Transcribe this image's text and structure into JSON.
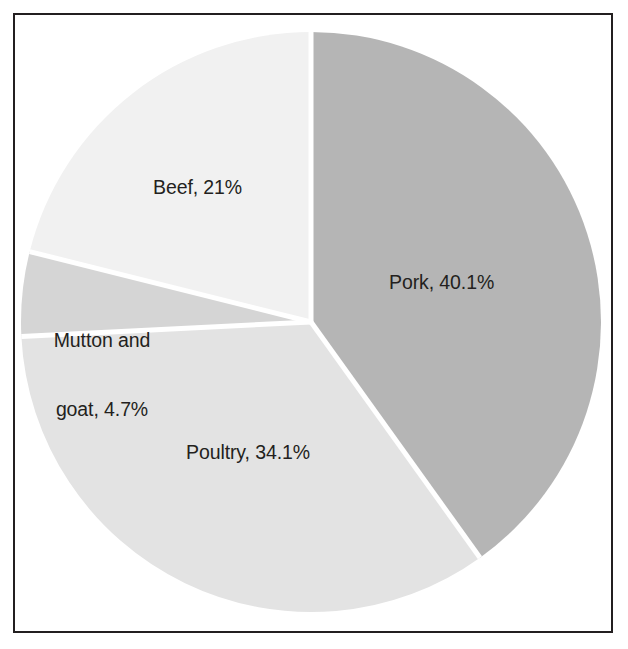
{
  "figure": {
    "kind": "pie-chart-figure",
    "background_color": "#ffffff",
    "frame_color": "#231f20",
    "label_text_color": "#231f20"
  },
  "chart_data": {
    "type": "pie",
    "title": "",
    "subtitle": "",
    "xlabel": "",
    "ylabel": "",
    "legend_position": "none",
    "grid": false,
    "labels_inside_slices": true,
    "start_angle_deg": 0,
    "direction": "clockwise",
    "units": "percent",
    "categories": [
      "Pork",
      "Poultry",
      "Mutton and goat",
      "Beef"
    ],
    "values": [
      40.1,
      34.1,
      4.7,
      21.0
    ],
    "total": 99.9,
    "colors": [
      "#b5b5b5",
      "#e3e3e3",
      "#d5d5d5",
      "#f1f1f1"
    ],
    "slices": [
      {
        "name": "Pork",
        "value": 40.1,
        "value_text": "40.1%",
        "label": "Pork, 40.1%",
        "label_lines": [
          "Pork, 40.1%"
        ],
        "color": "#b5b5b5",
        "start_angle_deg": 0.0,
        "end_angle_deg": 144.36
      },
      {
        "name": "Poultry",
        "value": 34.1,
        "value_text": "34.1%",
        "label": "Poultry, 34.1%",
        "label_lines": [
          "Poultry, 34.1%"
        ],
        "color": "#e3e3e3",
        "start_angle_deg": 144.36,
        "end_angle_deg": 267.12
      },
      {
        "name": "Mutton and goat",
        "value": 4.7,
        "value_text": "4.7%",
        "label": "Mutton and goat, 4.7%",
        "label_lines": [
          "Mutton and",
          "goat, 4.7%"
        ],
        "color": "#d5d5d5",
        "start_angle_deg": 267.12,
        "end_angle_deg": 284.04
      },
      {
        "name": "Beef",
        "value": 21.0,
        "value_text": "21%",
        "label": "Beef, 21%",
        "label_lines": [
          "Beef, 21%"
        ],
        "color": "#f1f1f1",
        "start_angle_deg": 284.04,
        "end_angle_deg": 360.0
      }
    ]
  }
}
